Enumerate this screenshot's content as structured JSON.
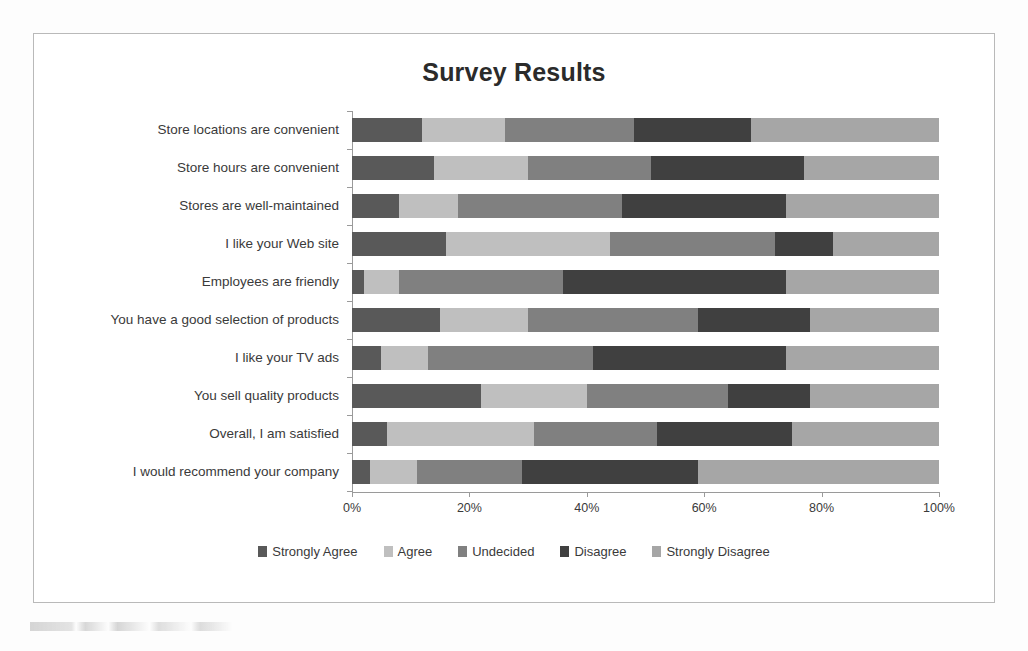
{
  "chart_data": {
    "type": "bar",
    "subtype": "horizontal-100-percent-stacked",
    "title": "Survey Results",
    "xlabel": "",
    "ylabel": "",
    "xlim": [
      0,
      100
    ],
    "grid": false,
    "legend_position": "bottom",
    "x_tick_labels": [
      "0%",
      "20%",
      "40%",
      "60%",
      "80%",
      "100%"
    ],
    "x_tick_values": [
      0,
      20,
      40,
      60,
      80,
      100
    ],
    "categories": [
      "Store locations are convenient",
      "Store hours are convenient",
      "Stores are well-maintained",
      "I like your Web site",
      "Employees are friendly",
      "You have a good selection of products",
      "I like your TV ads",
      "You sell quality products",
      "Overall, I am satisfied",
      "I would recommend your company"
    ],
    "series": [
      {
        "name": "Strongly Agree",
        "color": "#595959",
        "values": [
          12,
          14,
          8,
          16,
          2,
          15,
          5,
          22,
          6,
          3
        ]
      },
      {
        "name": "Agree",
        "color": "#bfbfbf",
        "values": [
          14,
          16,
          10,
          28,
          6,
          15,
          8,
          18,
          25,
          8
        ]
      },
      {
        "name": "Undecided",
        "color": "#808080",
        "values": [
          22,
          21,
          28,
          28,
          28,
          29,
          28,
          24,
          21,
          18
        ]
      },
      {
        "name": "Disagree",
        "color": "#404040",
        "values": [
          20,
          26,
          28,
          10,
          38,
          19,
          33,
          14,
          23,
          30
        ]
      },
      {
        "name": "Strongly Disagree",
        "color": "#a6a6a6",
        "values": [
          32,
          23,
          26,
          18,
          26,
          22,
          26,
          22,
          25,
          41
        ]
      }
    ]
  },
  "legend": {
    "items": [
      {
        "label": "Strongly Agree",
        "color": "#595959"
      },
      {
        "label": "Agree",
        "color": "#bfbfbf"
      },
      {
        "label": "Undecided",
        "color": "#808080"
      },
      {
        "label": "Disagree",
        "color": "#404040"
      },
      {
        "label": "Strongly Disagree",
        "color": "#a6a6a6"
      }
    ]
  },
  "colors": {
    "frame_border": "#b9b9b9",
    "axis": "#9a9a9a",
    "text": "#3a3a3a",
    "title": "#2b2b2b",
    "background": "#ffffff"
  }
}
